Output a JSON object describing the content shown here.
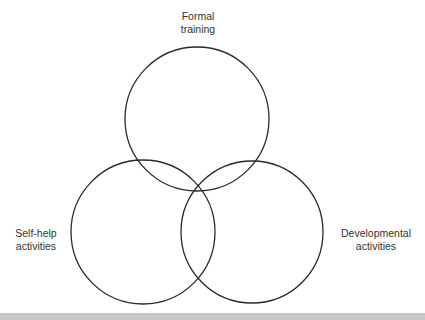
{
  "diagram": {
    "type": "venn",
    "stroke_color": "#2a2a2a",
    "circles": [
      {
        "id": "formal-training",
        "cx": 197,
        "cy": 119,
        "r": 72,
        "label_lines": [
          "Formal",
          "training"
        ]
      },
      {
        "id": "self-help-activities",
        "cx": 143,
        "cy": 232,
        "r": 72,
        "label_lines": [
          "Self-help",
          "activities"
        ]
      },
      {
        "id": "developmental-activities",
        "cx": 252,
        "cy": 232,
        "r": 71,
        "label_lines": [
          "Developmental",
          "activities"
        ]
      }
    ]
  },
  "labels": {
    "formal": {
      "line1": "Formal",
      "line2": "training"
    },
    "selfhelp": {
      "line1": "Self-help",
      "line2": "activities"
    },
    "developmental": {
      "line1": "Developmental",
      "line2": "activities"
    }
  }
}
